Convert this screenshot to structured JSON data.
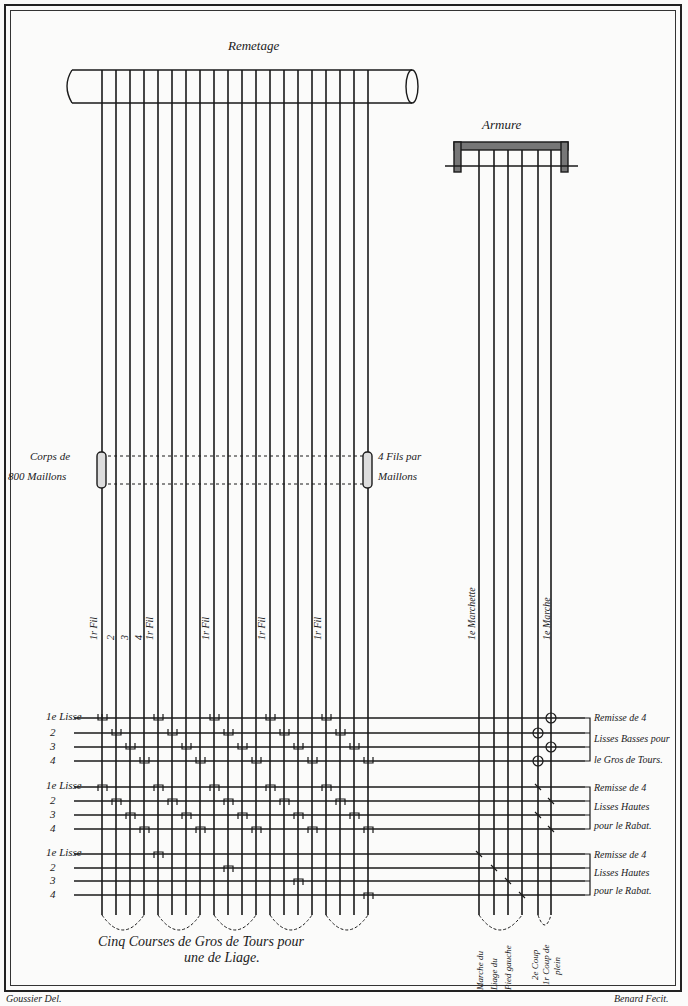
{
  "remetage": {
    "title": "Remetage"
  },
  "armure": {
    "title": "Armure"
  },
  "corps": {
    "line1": "Corps de",
    "line2": "800 Maillons"
  },
  "fils": {
    "line1": "4 Fils par",
    "line2": "Maillons"
  },
  "thread_labels": {
    "first": "1r Fil",
    "n2": "2",
    "n3": "3",
    "n4": "4"
  },
  "treadle_labels": {
    "first": "1e Marchette",
    "n2": "2",
    "n3": "3",
    "n4": "4",
    "m2": "2",
    "march": "1e Marche"
  },
  "lisse_groups": [
    {
      "lisse_label": "1e Lisse",
      "rows": [
        "2",
        "3",
        "4"
      ],
      "note": [
        "Remisse de 4",
        "Lisses Basses pour",
        "le Gros de Tours."
      ]
    },
    {
      "lisse_label": "1e Lisse",
      "rows": [
        "2",
        "3",
        "4"
      ],
      "note": [
        "Remisse de 4",
        "Lisses Hautes",
        "pour le Rabat."
      ]
    },
    {
      "lisse_label": "1e Lisse",
      "rows": [
        "2",
        "3",
        "4"
      ],
      "note": [
        "Remisse de 4",
        "Lisses Hautes",
        "pour le Rabat."
      ]
    }
  ],
  "bottom_caption": {
    "line1": "Cinq Courses de Gros de Tours pour",
    "line2": "une de Liage."
  },
  "treadle_caption": {
    "a": "Marche du",
    "b": "Liage du",
    "c": "Pied gauche",
    "d": "2e Coup",
    "e": "1r Coup de",
    "f": "plein"
  },
  "signatures": {
    "left": "Goussier Del.",
    "right": "Benard Fecit."
  }
}
